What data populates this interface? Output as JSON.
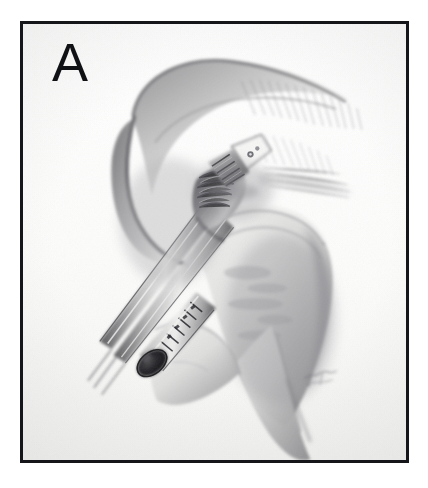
{
  "figure": {
    "panel_label": "A",
    "domain": "medical-surgical-illustration",
    "medium": "graphite pencil drawing",
    "caption": "",
    "background_color": "#ffffff",
    "plate_background_color": "#fdfdfc",
    "border_color": "#15161a",
    "ink_color": "#4a4a4c",
    "shadow_color": "#6d6d70",
    "deep_shadow_color": "#2b2b2e"
  },
  "frame": {
    "x": 20,
    "y": 21,
    "width": 389,
    "height": 442,
    "border_width": 3
  },
  "scene": {
    "title": "Arthroscopic shoulder repair",
    "anatomy": [
      {
        "name": "acromion-coracoacromial-arch",
        "description": "Large curved bone arch sweeping from upper-left across the top with hatched shading on its right flank"
      },
      {
        "name": "glenoid-labrum-rim",
        "description": "Soft-tissue rim beneath the arch where the anchor is seated"
      },
      {
        "name": "humeral-head",
        "description": "Rounded bone mass occupying the right-central region"
      },
      {
        "name": "greater-tuberosity",
        "description": "Lower bony ridge of the humerus descending to the bottom right"
      },
      {
        "name": "soft-tissue-flap",
        "description": "Pale tissue flap draped over the lower-left bone margin"
      }
    ],
    "instruments": [
      {
        "name": "suture-anchor",
        "description": "Threaded suture anchor seated in bone at the upper middle",
        "position": "upper-middle"
      },
      {
        "name": "arthroscopic-grasper",
        "description": "Grasper jaws gripping tissue in the centre of the joint",
        "position": "centre"
      },
      {
        "name": "instrument-shaft",
        "description": "Two long slender instrument shafts running down-left out of frame",
        "position": "left-diagonal"
      },
      {
        "name": "cannula",
        "description": "Graduated cannula with depth markings and dark open lumen at the lower left",
        "position": "lower-left"
      }
    ],
    "signature": {
      "present": true,
      "text": "",
      "position": "lower-right of drawing"
    }
  }
}
